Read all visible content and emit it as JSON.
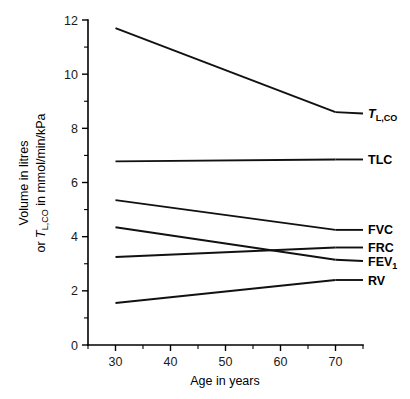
{
  "chart_data": {
    "type": "line",
    "title": "",
    "xlabel": "Age in years",
    "ylabel": "Volume in litres or TL,CO in mmol/min/kPa",
    "ylabel_line1": "Volume in litres",
    "ylabel_line2_prefix": "or ",
    "ylabel_line2_symbol": "T",
    "ylabel_line2_sub": "L,CO",
    "ylabel_line2_suffix": " in mmol/min/kPa",
    "x": [
      30,
      70
    ],
    "xlim": [
      25,
      75
    ],
    "ylim": [
      0,
      12
    ],
    "xticks": [
      30,
      40,
      50,
      60,
      70
    ],
    "xtick_labels": [
      "30",
      "40",
      "50",
      "60",
      "70"
    ],
    "x_minor_ticks": [
      25,
      35,
      45,
      55,
      65,
      75
    ],
    "yticks": [
      0,
      2,
      4,
      6,
      8,
      10,
      12
    ],
    "ytick_labels": [
      "0",
      "2",
      "4",
      "6",
      "8",
      "10",
      "12"
    ],
    "y_minor_ticks": [
      1,
      3,
      5,
      7,
      9,
      11
    ],
    "grid": false,
    "legend_position": "right-inline-labels",
    "series": [
      {
        "name": "TL,CO",
        "label_text": "T",
        "label_sub": "L,CO",
        "label_italic": true,
        "values": [
          11.7,
          8.6
        ],
        "label_y": 8.55
      },
      {
        "name": "TLC",
        "label_text": "TLC",
        "label_sub": "",
        "label_italic": false,
        "values": [
          6.78,
          6.85
        ],
        "label_y": 6.85
      },
      {
        "name": "FVC",
        "label_text": "FVC",
        "label_sub": "",
        "label_italic": false,
        "values": [
          5.35,
          4.25
        ],
        "label_y": 4.25
      },
      {
        "name": "FRC",
        "label_text": "FRC",
        "label_sub": "",
        "label_italic": false,
        "values": [
          3.25,
          3.6
        ],
        "label_y": 3.6
      },
      {
        "name": "FEV1",
        "label_text": "FEV",
        "label_sub": "1",
        "label_italic": false,
        "values": [
          4.35,
          3.15
        ],
        "label_y": 3.1
      },
      {
        "name": "RV",
        "label_text": "RV",
        "label_sub": "",
        "label_italic": false,
        "values": [
          1.55,
          2.4
        ],
        "label_y": 2.4
      }
    ],
    "colors": {
      "line": "#111111",
      "axis": "#000000",
      "text": "#000000",
      "background": "#ffffff"
    }
  }
}
